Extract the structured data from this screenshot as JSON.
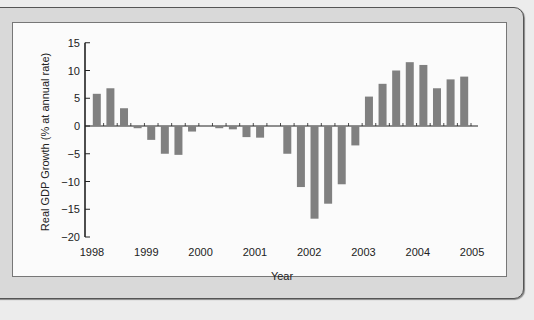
{
  "background_text": {
    "heading_word": "Global",
    "heading_title": "China and the Economic in 1997-1998"
  },
  "chart_data": {
    "type": "bar",
    "title": "",
    "xlabel": "Year",
    "ylabel": "Real GDP Growth (% at annual rate)",
    "ylim": [
      -20,
      15
    ],
    "yticks": [
      15,
      10,
      5,
      0,
      -5,
      -10,
      -15,
      -20
    ],
    "ytick_labels": [
      "15",
      "10",
      "5",
      "0",
      "−5",
      "−10",
      "−15",
      "−20"
    ],
    "xtick_labels": [
      "1998",
      "1999",
      "2000",
      "2001",
      "2002",
      "2003",
      "2004",
      "2005"
    ],
    "grid": false,
    "legend": null,
    "bar_color": "#808080",
    "categories": [
      "1998Q1",
      "1998Q2",
      "1998Q3",
      "1998Q4",
      "1999Q1",
      "1999Q2",
      "1999Q3",
      "1999Q4",
      "2000Q1",
      "2000Q2",
      "2000Q3",
      "2000Q4",
      "2001Q1",
      "2001Q2",
      "2001Q3",
      "2001Q4",
      "2002Q1",
      "2002Q2",
      "2002Q3",
      "2002Q4",
      "2003Q1",
      "2003Q2",
      "2003Q3",
      "2003Q4",
      "2004Q1",
      "2004Q2",
      "2004Q3",
      "2004Q4"
    ],
    "values": [
      5.8,
      6.8,
      3.2,
      -0.4,
      -2.5,
      -5.0,
      -5.2,
      -1.0,
      0.0,
      -0.4,
      -0.6,
      -2.0,
      -2.1,
      0.0,
      -5.0,
      -11.0,
      -16.7,
      -14.0,
      -10.5,
      -3.5,
      5.3,
      7.6,
      10.0,
      11.5,
      11.0,
      6.8,
      8.4,
      8.9
    ]
  }
}
